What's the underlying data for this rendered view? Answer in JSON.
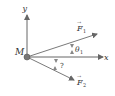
{
  "diagram": {
    "origin_label": "M",
    "x_axis_label": "x",
    "y_axis_label": "y",
    "force1": {
      "symbol": "F",
      "subscript": "1",
      "arrow": "→"
    },
    "force2": {
      "symbol": "F",
      "subscript": "2",
      "arrow": "→"
    },
    "angle1": {
      "symbol": "θ",
      "subscript": "1"
    },
    "angle2": {
      "symbol": "?"
    },
    "colors": {
      "axis": "#555555",
      "vector": "#7a7a7a",
      "origin_dot": "#777777",
      "text": "#333333"
    }
  }
}
